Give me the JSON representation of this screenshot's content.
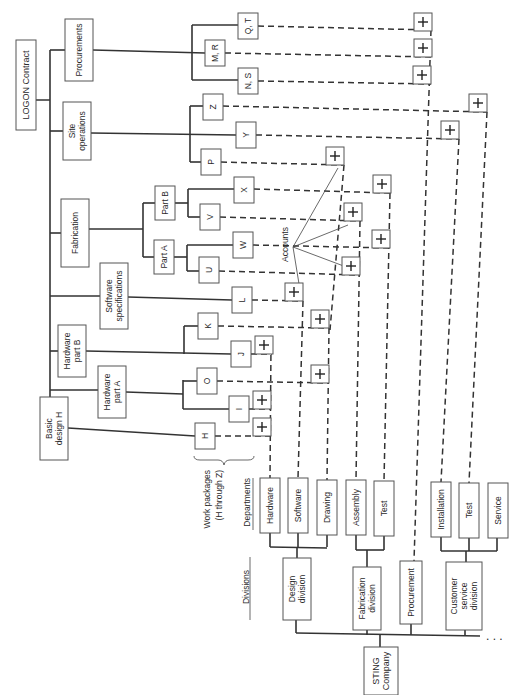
{
  "title": "LOGON Contract",
  "company": "STING Company",
  "labels": {
    "work_packages": "Work packages",
    "work_packages_range": "(H through Z)",
    "departments": "Departments",
    "divisions": "Divisions",
    "accounts": "Accounts",
    "ellipsis": ". . ."
  },
  "contract_elements": [
    {
      "id": "basic_design_h",
      "lines": [
        "Basic",
        "design H"
      ],
      "x": 40,
      "y": 397,
      "w": 28,
      "h": 63
    },
    {
      "id": "hardware_part_a",
      "lines": [
        "Hardware",
        "part A"
      ],
      "x": 98,
      "y": 366,
      "w": 28,
      "h": 52
    },
    {
      "id": "hardware_part_b",
      "lines": [
        "Hardware",
        "part B"
      ],
      "x": 58,
      "y": 325,
      "w": 28,
      "h": 52
    },
    {
      "id": "software_specifications",
      "lines": [
        "Software",
        "specifications"
      ],
      "x": 100,
      "y": 263,
      "w": 28,
      "h": 66
    },
    {
      "id": "fabrication",
      "lines": [
        "Fabrication"
      ],
      "x": 61,
      "y": 199,
      "w": 28,
      "h": 68
    },
    {
      "id": "site_operations",
      "lines": [
        "Site",
        "operations"
      ],
      "x": 63,
      "y": 102,
      "w": 28,
      "h": 58
    },
    {
      "id": "procurements",
      "lines": [
        "Procurements"
      ],
      "x": 65,
      "y": 19,
      "w": 28,
      "h": 62
    }
  ],
  "sub_elements": [
    {
      "id": "part_a",
      "label": "Part A",
      "x": 154,
      "y": 240,
      "w": 20,
      "h": 34
    },
    {
      "id": "part_b",
      "label": "Part B",
      "x": 155,
      "y": 186,
      "w": 20,
      "h": 34
    }
  ],
  "work_packages": [
    {
      "label": "H",
      "x": 195,
      "y": 423,
      "w": 20,
      "h": 26
    },
    {
      "label": "I",
      "x": 229,
      "y": 396,
      "w": 20,
      "h": 26
    },
    {
      "label": "O",
      "x": 197,
      "y": 368,
      "w": 20,
      "h": 26
    },
    {
      "label": "J",
      "x": 231,
      "y": 341,
      "w": 20,
      "h": 26
    },
    {
      "label": "K",
      "x": 198,
      "y": 313,
      "w": 20,
      "h": 26
    },
    {
      "label": "L",
      "x": 232,
      "y": 287,
      "w": 20,
      "h": 26
    },
    {
      "label": "U",
      "x": 199,
      "y": 257,
      "w": 20,
      "h": 26
    },
    {
      "label": "W",
      "x": 233,
      "y": 232,
      "w": 20,
      "h": 26
    },
    {
      "label": "V",
      "x": 200,
      "y": 204,
      "w": 20,
      "h": 26
    },
    {
      "label": "X",
      "x": 234,
      "y": 177,
      "w": 20,
      "h": 26
    },
    {
      "label": "P",
      "x": 201,
      "y": 149,
      "w": 20,
      "h": 26
    },
    {
      "label": "Y",
      "x": 236,
      "y": 122,
      "w": 20,
      "h": 26
    },
    {
      "label": "Z",
      "x": 203,
      "y": 94,
      "w": 20,
      "h": 26
    },
    {
      "label": "N, S",
      "x": 238,
      "y": 68,
      "w": 20,
      "h": 26
    },
    {
      "label": "M, R",
      "x": 205,
      "y": 40,
      "w": 20,
      "h": 26
    },
    {
      "label": "Q, T",
      "x": 238,
      "y": 13,
      "w": 20,
      "h": 26
    }
  ],
  "departments": [
    {
      "label": "Hardware",
      "x": 260,
      "y": 478,
      "w": 20,
      "h": 55
    },
    {
      "label": "Software",
      "x": 288,
      "y": 478,
      "w": 20,
      "h": 55
    },
    {
      "label": "Drawing",
      "x": 317,
      "y": 480,
      "w": 20,
      "h": 55
    },
    {
      "label": "Assembly",
      "x": 346,
      "y": 480,
      "w": 20,
      "h": 55
    },
    {
      "label": "Test",
      "x": 374,
      "y": 481,
      "w": 20,
      "h": 55
    },
    {
      "label": "Installation",
      "x": 431,
      "y": 482,
      "w": 20,
      "h": 55
    },
    {
      "label": "Test",
      "x": 459,
      "y": 483,
      "w": 20,
      "h": 55
    },
    {
      "label": "Service",
      "x": 488,
      "y": 483,
      "w": 20,
      "h": 55
    }
  ],
  "divisions": [
    {
      "label": "Design division",
      "lines": [
        "Design",
        "division"
      ],
      "x": 283,
      "y": 558,
      "w": 28,
      "h": 62
    },
    {
      "label": "Fabrication division",
      "lines": [
        "Fabrication",
        "division"
      ],
      "x": 353,
      "y": 567,
      "w": 28,
      "h": 63
    },
    {
      "label": "Procurement",
      "lines": [
        "Procurement"
      ],
      "x": 400,
      "y": 561,
      "w": 22,
      "h": 63
    },
    {
      "label": "Customer service division",
      "lines": [
        "Customer",
        "service",
        "division"
      ],
      "x": 446,
      "y": 562,
      "w": 36,
      "h": 68
    }
  ],
  "accounts": [
    {
      "x": 423,
      "y": 22
    },
    {
      "x": 423,
      "y": 48
    },
    {
      "x": 422,
      "y": 75
    },
    {
      "x": 478,
      "y": 103
    },
    {
      "x": 450,
      "y": 130
    },
    {
      "x": 335,
      "y": 156
    },
    {
      "x": 382,
      "y": 184
    },
    {
      "x": 353,
      "y": 212
    },
    {
      "x": 381,
      "y": 239
    },
    {
      "x": 351,
      "y": 266
    },
    {
      "x": 294,
      "y": 292
    },
    {
      "x": 320,
      "y": 319
    },
    {
      "x": 264,
      "y": 345
    },
    {
      "x": 320,
      "y": 374
    },
    {
      "x": 262,
      "y": 400
    },
    {
      "x": 262,
      "y": 427
    }
  ],
  "colors": {
    "line": "#333333",
    "box_border": "#555555",
    "background": "#ffffff"
  }
}
